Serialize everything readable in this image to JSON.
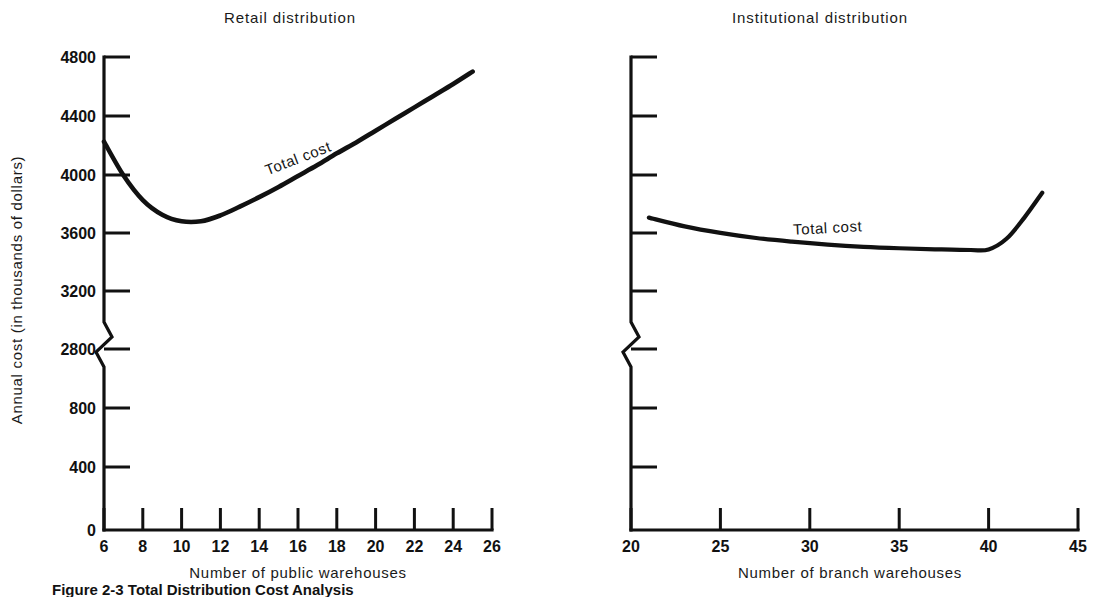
{
  "figure": {
    "caption": "Figure 2-3 Total Distribution Cost Analysis",
    "y_axis_label": "Annual cost (in thousands of dollars)"
  },
  "panels": {
    "left": {
      "title": "Retail distribution",
      "xlabel": "Number of public warehouses",
      "series_label": "Total cost",
      "yticks": [
        "4800",
        "4400",
        "4000",
        "3600",
        "3200",
        "2800",
        "800",
        "400",
        "0"
      ],
      "xticks": [
        "6",
        "8",
        "10",
        "12",
        "14",
        "16",
        "18",
        "20",
        "22",
        "24",
        "26"
      ]
    },
    "right": {
      "title": "Institutional distribution",
      "xlabel": "Number of branch warehouses",
      "series_label": "Total cost",
      "yticks": [
        "",
        "",
        "",
        "",
        "",
        "",
        "",
        "",
        ""
      ],
      "xticks": [
        "20",
        "25",
        "30",
        "35",
        "40",
        "45"
      ]
    }
  },
  "colors": {
    "ink": "#111111",
    "background": "#ffffff",
    "curve": "#111111"
  },
  "chart_data": [
    {
      "type": "line",
      "panel": "left",
      "title": "Retail distribution",
      "xlabel": "Number of public warehouses",
      "ylabel": "Annual cost (in thousands of dollars)",
      "series_name": "Total cost",
      "xlim": [
        6,
        26
      ],
      "ylim": [
        0,
        4800
      ],
      "yaxis_break": [
        800,
        2800
      ],
      "xticks": [
        6,
        8,
        10,
        12,
        14,
        16,
        18,
        20,
        22,
        24,
        26
      ],
      "yticks": [
        0,
        400,
        800,
        2800,
        3200,
        3600,
        4000,
        4400,
        4800
      ],
      "grid": false,
      "legend": "inline-curve-label",
      "x": [
        6,
        7,
        8,
        9,
        10,
        11,
        12,
        13,
        14,
        15,
        16,
        17,
        18,
        19,
        20,
        21,
        22,
        23,
        24,
        25
      ],
      "values": [
        4220,
        3990,
        3820,
        3720,
        3675,
        3675,
        3715,
        3775,
        3840,
        3910,
        3985,
        4060,
        4140,
        4215,
        4295,
        4375,
        4455,
        4535,
        4615,
        4700
      ]
    },
    {
      "type": "line",
      "panel": "right",
      "title": "Institutional distribution",
      "xlabel": "Number of branch warehouses",
      "ylabel": "Annual cost (in thousands of dollars)",
      "series_name": "Total cost",
      "xlim": [
        20,
        45
      ],
      "ylim": [
        0,
        4800
      ],
      "yaxis_break": [
        800,
        2800
      ],
      "xticks": [
        20,
        25,
        30,
        35,
        40,
        45
      ],
      "yticks": [
        0,
        400,
        800,
        2800,
        3200,
        3600,
        4000,
        4400,
        4800
      ],
      "grid": false,
      "legend": "inline-curve-label",
      "x": [
        21,
        23,
        25,
        27,
        29,
        31,
        33,
        35,
        37,
        39,
        40,
        41,
        42,
        43
      ],
      "values": [
        3700,
        3640,
        3595,
        3560,
        3535,
        3515,
        3500,
        3490,
        3483,
        3478,
        3482,
        3555,
        3700,
        3870
      ]
    }
  ]
}
